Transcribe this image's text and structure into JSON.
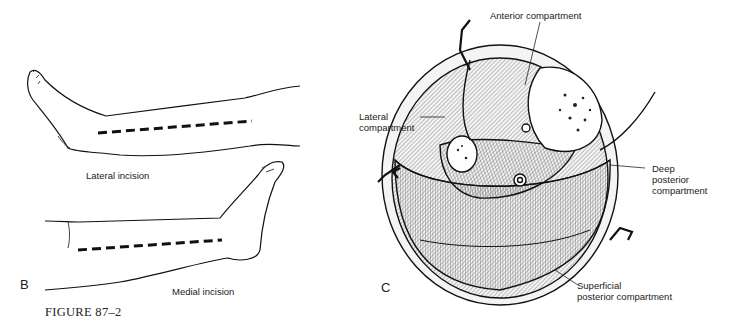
{
  "figure": {
    "caption": "FIGURE 87–2"
  },
  "panel_b": {
    "letter": "B",
    "labels": {
      "lateral": "Lateral incision",
      "medial": "Medial incision"
    }
  },
  "panel_c": {
    "letter": "C",
    "labels": {
      "anterior": "Anterior compartment",
      "lateral_line1": "Lateral",
      "lateral_line2": "compartment",
      "deep_line1": "Deep",
      "deep_line2": "posterior",
      "deep_line3": "compartment",
      "superficial_line1": "Superficial",
      "superficial_line2": "posterior compartment"
    }
  }
}
